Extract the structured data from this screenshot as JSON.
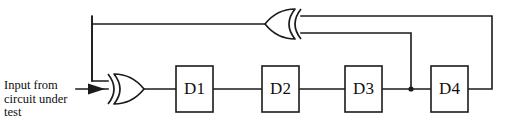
{
  "diagram": {
    "type": "circuit-schematic",
    "canvas": {
      "width": 509,
      "height": 131,
      "background": "#ffffff"
    },
    "stroke_color": "#1b1b1b",
    "input_caption": "Input from\ncircuit under\ntest",
    "flip_flops": [
      {
        "id": "d1",
        "label": "D1",
        "x": 176,
        "y": 66,
        "w": 37,
        "h": 46
      },
      {
        "id": "d2",
        "label": "D2",
        "x": 262,
        "y": 66,
        "w": 37,
        "h": 46
      },
      {
        "id": "d3",
        "label": "D3",
        "x": 345,
        "y": 66,
        "w": 37,
        "h": 46
      },
      {
        "id": "d4",
        "label": "D4",
        "x": 431,
        "y": 66,
        "w": 37,
        "h": 46
      }
    ],
    "gates": [
      {
        "id": "xor-input",
        "type": "xor-gate",
        "orientation": "right",
        "x": 108,
        "y": 74,
        "w": 36,
        "h": 30
      },
      {
        "id": "xor-feedback",
        "type": "xor-gate",
        "orientation": "left",
        "x": 265,
        "y": 9,
        "w": 36,
        "h": 30
      }
    ],
    "junctions": [
      {
        "id": "tap-d3-output",
        "x": 411,
        "y": 89
      }
    ],
    "arrows": [
      {
        "id": "input-arrow",
        "x": 105,
        "y": 89,
        "direction": "right"
      }
    ],
    "wire_labels": {
      "input_line": "input from circuit under test",
      "feedback_top": "feedback from D4 output",
      "feedback_tap": "tap from D3 output",
      "xor_output": "XOR feedback into input XOR"
    }
  }
}
